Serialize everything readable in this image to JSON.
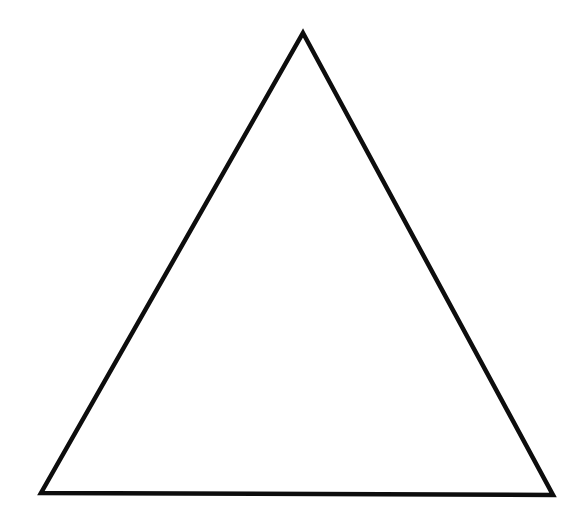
{
  "figure": {
    "canvas": {
      "width": 587,
      "height": 526,
      "background_color": "#ffffff"
    },
    "shapes": [
      {
        "name": "triangle",
        "type": "polygon",
        "sides": 3,
        "fill": "none",
        "stroke_color": "#0d0d0d",
        "stroke_width": 4.5,
        "vertices": [
          {
            "label": "apex",
            "x": 303,
            "y": 33
          },
          {
            "label": "bottom-right",
            "x": 553,
            "y": 495
          },
          {
            "label": "bottom-left",
            "x": 41,
            "y": 493
          }
        ],
        "points": "303,33 553,495 41,493"
      }
    ],
    "labels": [],
    "annotations": []
  }
}
